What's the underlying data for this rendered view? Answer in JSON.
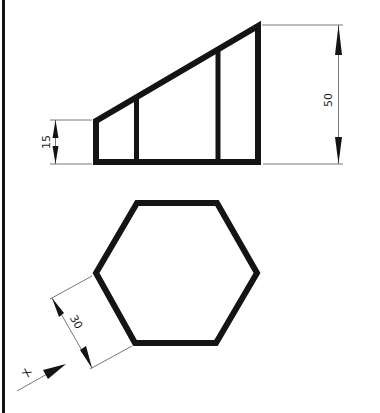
{
  "drawing": {
    "colors": {
      "outline": "#141414",
      "dimension": "#555555",
      "background": "#ffffff"
    },
    "elevation_view": {
      "shape": "stepped-trapezoid",
      "dimensions": {
        "left_height": {
          "label": "15"
        },
        "right_height": {
          "label": "50"
        }
      }
    },
    "plan_view": {
      "shape": "hexagon",
      "dimensions": {
        "edge_length": {
          "label": "30"
        }
      }
    },
    "view_direction": {
      "label": "X"
    }
  }
}
